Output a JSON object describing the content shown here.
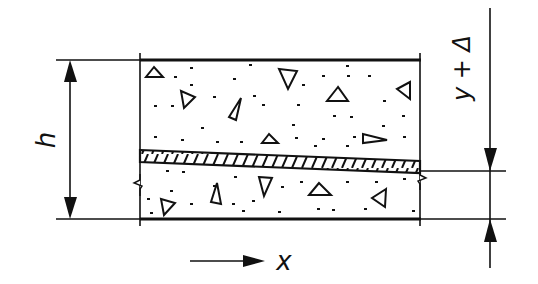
{
  "figure": {
    "labels": {
      "height": "h",
      "offset": "y + Δ",
      "axis": "x"
    },
    "colors": {
      "ink": "#111111",
      "background": "#ffffff"
    }
  }
}
